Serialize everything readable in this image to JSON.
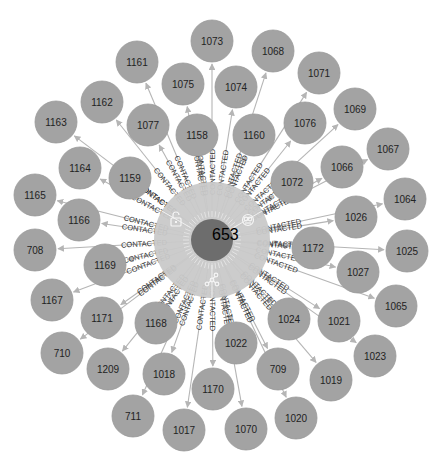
{
  "graph": {
    "center": {
      "id": "653",
      "x": 212,
      "y": 240,
      "r": 21,
      "ring_r": 58
    },
    "edge_label": "CONTACTED",
    "ring_menu": [
      {
        "name": "lock-icon",
        "x": 176,
        "y": 220
      },
      {
        "name": "expand-icon",
        "x": 248,
        "y": 220
      },
      {
        "name": "network-icon",
        "x": 212,
        "y": 280
      }
    ],
    "node_radius": 21,
    "colors": {
      "node": "#a3a3a3",
      "center": "#6d6d6d",
      "ring": "#c9c9c9",
      "edge": "#b5b5b5"
    },
    "nodes": [
      {
        "id": "1073",
        "x": 212,
        "y": 41
      },
      {
        "id": "1068",
        "x": 273,
        "y": 51
      },
      {
        "id": "1161",
        "x": 137,
        "y": 62
      },
      {
        "id": "1071",
        "x": 319,
        "y": 73
      },
      {
        "id": "1075",
        "x": 183,
        "y": 84
      },
      {
        "id": "1074",
        "x": 236,
        "y": 87
      },
      {
        "id": "1162",
        "x": 102,
        "y": 102
      },
      {
        "id": "1069",
        "x": 355,
        "y": 109
      },
      {
        "id": "1163",
        "x": 56,
        "y": 122
      },
      {
        "id": "1076",
        "x": 305,
        "y": 123
      },
      {
        "id": "1077",
        "x": 148,
        "y": 125
      },
      {
        "id": "1158",
        "x": 197,
        "y": 135
      },
      {
        "id": "1160",
        "x": 254,
        "y": 135
      },
      {
        "id": "1067",
        "x": 388,
        "y": 149
      },
      {
        "id": "1066",
        "x": 342,
        "y": 167
      },
      {
        "id": "1164",
        "x": 80,
        "y": 168
      },
      {
        "id": "1159",
        "x": 130,
        "y": 178
      },
      {
        "id": "1072",
        "x": 292,
        "y": 182
      },
      {
        "id": "1165",
        "x": 35,
        "y": 195
      },
      {
        "id": "1064",
        "x": 405,
        "y": 199
      },
      {
        "id": "1026",
        "x": 356,
        "y": 217
      },
      {
        "id": "1166",
        "x": 79,
        "y": 220
      },
      {
        "id": "1172",
        "x": 313,
        "y": 248
      },
      {
        "id": "708",
        "x": 35,
        "y": 250
      },
      {
        "id": "1025",
        "x": 407,
        "y": 251
      },
      {
        "id": "1169",
        "x": 105,
        "y": 265
      },
      {
        "id": "1027",
        "x": 358,
        "y": 272
      },
      {
        "id": "1167",
        "x": 52,
        "y": 300
      },
      {
        "id": "1065",
        "x": 396,
        "y": 306
      },
      {
        "id": "1171",
        "x": 102,
        "y": 318
      },
      {
        "id": "1024",
        "x": 289,
        "y": 319
      },
      {
        "id": "1021",
        "x": 339,
        "y": 321
      },
      {
        "id": "1168",
        "x": 156,
        "y": 323
      },
      {
        "id": "1022",
        "x": 236,
        "y": 343
      },
      {
        "id": "710",
        "x": 62,
        "y": 353
      },
      {
        "id": "1023",
        "x": 375,
        "y": 356
      },
      {
        "id": "1209",
        "x": 108,
        "y": 369
      },
      {
        "id": "709",
        "x": 278,
        "y": 369
      },
      {
        "id": "1018",
        "x": 164,
        "y": 374
      },
      {
        "id": "1019",
        "x": 331,
        "y": 380
      },
      {
        "id": "1170",
        "x": 213,
        "y": 389
      },
      {
        "id": "711",
        "x": 133,
        "y": 416
      },
      {
        "id": "1020",
        "x": 296,
        "y": 418
      },
      {
        "id": "1070",
        "x": 246,
        "y": 429
      },
      {
        "id": "1017",
        "x": 184,
        "y": 430
      }
    ]
  }
}
